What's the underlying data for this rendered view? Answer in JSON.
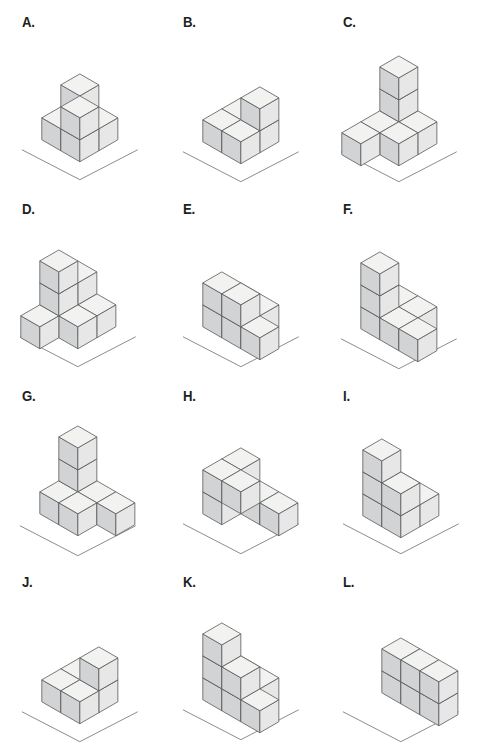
{
  "sheet": {
    "title": "Isometric Cube Figures",
    "background_color": "#ffffff",
    "columns": 3,
    "rows": 4
  },
  "style": {
    "top_face_color": "#f2f2f1",
    "left_face_color": "#d2d3d4",
    "right_face_color": "#e7e7e7",
    "edge_color": "#58595b",
    "ground_line_color": "#6d6e71",
    "label_color": "#231f20"
  },
  "figures": [
    {
      "label": "A.",
      "name": "figure-a",
      "cube_count": 6,
      "origin": {
        "x": 80,
        "y": 118
      },
      "cube_size": 22,
      "ground": {
        "cx": 80,
        "cy": 150,
        "half_width": 58,
        "depth": 30
      },
      "cubes": [
        {
          "x": 0,
          "y": 0,
          "z": 0
        },
        {
          "x": 1,
          "y": 0,
          "z": 0
        },
        {
          "x": 0,
          "y": 1,
          "z": 0
        },
        {
          "x": 1,
          "y": 1,
          "z": 0
        },
        {
          "x": 0,
          "y": 0,
          "z": 1
        },
        {
          "x": 1,
          "y": 1,
          "z": 1
        }
      ]
    },
    {
      "label": "B.",
      "name": "figure-b",
      "cube_count": 5,
      "origin": {
        "x": 80,
        "y": 120
      },
      "cube_size": 22,
      "ground": {
        "cx": 80,
        "cy": 152,
        "half_width": 58,
        "depth": 30
      },
      "cubes": [
        {
          "x": 0,
          "y": 0,
          "z": 0
        },
        {
          "x": 1,
          "y": 0,
          "z": 0
        },
        {
          "x": 0,
          "y": 1,
          "z": 0
        },
        {
          "x": 1,
          "y": 1,
          "z": 0
        },
        {
          "x": 1,
          "y": 0,
          "z": 1
        }
      ]
    },
    {
      "label": "C.",
      "name": "figure-c",
      "cube_count": 7,
      "origin": {
        "x": 78,
        "y": 122
      },
      "cube_size": 22,
      "ground": {
        "cx": 78,
        "cy": 152,
        "half_width": 58,
        "depth": 30
      },
      "cubes": [
        {
          "x": 0,
          "y": 0,
          "z": 0
        },
        {
          "x": 1,
          "y": 0,
          "z": 0
        },
        {
          "x": 0,
          "y": 1,
          "z": 0
        },
        {
          "x": 1,
          "y": 1,
          "z": 0
        },
        {
          "x": 0,
          "y": 2,
          "z": 0
        },
        {
          "x": 0,
          "y": 0,
          "z": 1
        },
        {
          "x": 0,
          "y": 0,
          "z": 2
        }
      ]
    },
    {
      "label": "D.",
      "name": "figure-d",
      "cube_count": 8,
      "origin": {
        "x": 78,
        "y": 118
      },
      "cube_size": 22,
      "ground": {
        "cx": 78,
        "cy": 150,
        "half_width": 58,
        "depth": 30
      },
      "cubes": [
        {
          "x": 0,
          "y": 0,
          "z": 0
        },
        {
          "x": 1,
          "y": 0,
          "z": 0
        },
        {
          "x": 0,
          "y": 1,
          "z": 0
        },
        {
          "x": 1,
          "y": 1,
          "z": 0
        },
        {
          "x": 0,
          "y": 2,
          "z": 0
        },
        {
          "x": 0,
          "y": 0,
          "z": 1
        },
        {
          "x": 0,
          "y": 1,
          "z": 1
        },
        {
          "x": 0,
          "y": 1,
          "z": 2
        }
      ]
    },
    {
      "label": "E.",
      "name": "figure-e",
      "cube_count": 7,
      "origin": {
        "x": 80,
        "y": 118
      },
      "cube_size": 22,
      "ground": {
        "cx": 80,
        "cy": 150,
        "half_width": 58,
        "depth": 30
      },
      "cubes": [
        {
          "x": 0,
          "y": 0,
          "z": 0
        },
        {
          "x": 1,
          "y": 0,
          "z": 0
        },
        {
          "x": 0,
          "y": 1,
          "z": 0
        },
        {
          "x": 1,
          "y": 1,
          "z": 0
        },
        {
          "x": 2,
          "y": 1,
          "z": 0
        },
        {
          "x": 0,
          "y": 1,
          "z": 1
        },
        {
          "x": 1,
          "y": 1,
          "z": 1
        }
      ]
    },
    {
      "label": "F.",
      "name": "figure-f",
      "cube_count": 7,
      "origin": {
        "x": 78,
        "y": 120
      },
      "cube_size": 22,
      "ground": {
        "cx": 78,
        "cy": 152,
        "half_width": 58,
        "depth": 30
      },
      "cubes": [
        {
          "x": 0,
          "y": 0,
          "z": 0
        },
        {
          "x": 1,
          "y": 0,
          "z": 0
        },
        {
          "x": 0,
          "y": 1,
          "z": 0
        },
        {
          "x": 1,
          "y": 1,
          "z": 0
        },
        {
          "x": 2,
          "y": 1,
          "z": 0
        },
        {
          "x": 0,
          "y": 1,
          "z": 1
        },
        {
          "x": 0,
          "y": 1,
          "z": 2
        }
      ]
    },
    {
      "label": "G.",
      "name": "figure-g",
      "cube_count": 7,
      "origin": {
        "x": 78,
        "y": 118
      },
      "cube_size": 22,
      "ground": {
        "cx": 78,
        "cy": 152,
        "half_width": 58,
        "depth": 30
      },
      "cubes": [
        {
          "x": 0,
          "y": 0,
          "z": 0
        },
        {
          "x": 1,
          "y": 0,
          "z": 0
        },
        {
          "x": 0,
          "y": 1,
          "z": 0
        },
        {
          "x": 1,
          "y": 1,
          "z": 0
        },
        {
          "x": 2,
          "y": 0,
          "z": 0
        },
        {
          "x": 0,
          "y": 0,
          "z": 1
        },
        {
          "x": 0,
          "y": 0,
          "z": 2
        }
      ]
    },
    {
      "label": "H.",
      "name": "figure-h",
      "cube_count": 7,
      "origin": {
        "x": 80,
        "y": 118
      },
      "cube_size": 22,
      "ground": {
        "cx": 80,
        "cy": 150,
        "half_width": 58,
        "depth": 30
      },
      "cubes": [
        {
          "x": 0,
          "y": 0,
          "z": 0
        },
        {
          "x": 1,
          "y": 0,
          "z": 0
        },
        {
          "x": 0,
          "y": 1,
          "z": 0
        },
        {
          "x": 2,
          "y": 0,
          "z": 0
        },
        {
          "x": 0,
          "y": 1,
          "z": 1
        },
        {
          "x": 1,
          "y": 1,
          "z": 1
        },
        {
          "x": 0,
          "y": 0,
          "z": 1
        }
      ]
    },
    {
      "label": "I.",
      "name": "figure-i",
      "cube_count": 7,
      "origin": {
        "x": 80,
        "y": 120
      },
      "cube_size": 22,
      "ground": {
        "cx": 80,
        "cy": 150,
        "half_width": 58,
        "depth": 30
      },
      "cubes": [
        {
          "x": 0,
          "y": 0,
          "z": 0
        },
        {
          "x": 1,
          "y": 0,
          "z": 0
        },
        {
          "x": 0,
          "y": 1,
          "z": 0
        },
        {
          "x": 1,
          "y": 1,
          "z": 0
        },
        {
          "x": 0,
          "y": 1,
          "z": 1
        },
        {
          "x": 1,
          "y": 1,
          "z": 1
        },
        {
          "x": 0,
          "y": 1,
          "z": 2
        }
      ]
    },
    {
      "label": "J.",
      "name": "figure-j",
      "cube_count": 5,
      "origin": {
        "x": 80,
        "y": 120
      },
      "cube_size": 22,
      "ground": {
        "cx": 80,
        "cy": 152,
        "half_width": 58,
        "depth": 30
      },
      "cubes": [
        {
          "x": 0,
          "y": 0,
          "z": 0
        },
        {
          "x": 1,
          "y": 0,
          "z": 0
        },
        {
          "x": 0,
          "y": 1,
          "z": 0
        },
        {
          "x": 1,
          "y": 1,
          "z": 0
        },
        {
          "x": 1,
          "y": 0,
          "z": 1
        }
      ]
    },
    {
      "label": "K.",
      "name": "figure-k",
      "cube_count": 8,
      "origin": {
        "x": 80,
        "y": 118
      },
      "cube_size": 22,
      "ground": {
        "cx": 80,
        "cy": 150,
        "half_width": 58,
        "depth": 30
      },
      "cubes": [
        {
          "x": 0,
          "y": 0,
          "z": 0
        },
        {
          "x": 1,
          "y": 0,
          "z": 0
        },
        {
          "x": 0,
          "y": 1,
          "z": 0
        },
        {
          "x": 1,
          "y": 1,
          "z": 0
        },
        {
          "x": 2,
          "y": 1,
          "z": 0
        },
        {
          "x": 0,
          "y": 1,
          "z": 1
        },
        {
          "x": 1,
          "y": 1,
          "z": 1
        },
        {
          "x": 0,
          "y": 1,
          "z": 2
        }
      ]
    },
    {
      "label": "L.",
      "name": "figure-l",
      "cube_count": 6,
      "origin": {
        "x": 80,
        "y": 122
      },
      "cube_size": 22,
      "ground": {
        "cx": 80,
        "cy": 152,
        "half_width": 58,
        "depth": 30
      },
      "cubes": [
        {
          "x": 0,
          "y": 0,
          "z": 0
        },
        {
          "x": 1,
          "y": 0,
          "z": 0
        },
        {
          "x": 2,
          "y": 0,
          "z": 0
        },
        {
          "x": 0,
          "y": 0,
          "z": 1
        },
        {
          "x": 1,
          "y": 0,
          "z": 1
        },
        {
          "x": 2,
          "y": 0,
          "z": 1
        }
      ]
    }
  ]
}
